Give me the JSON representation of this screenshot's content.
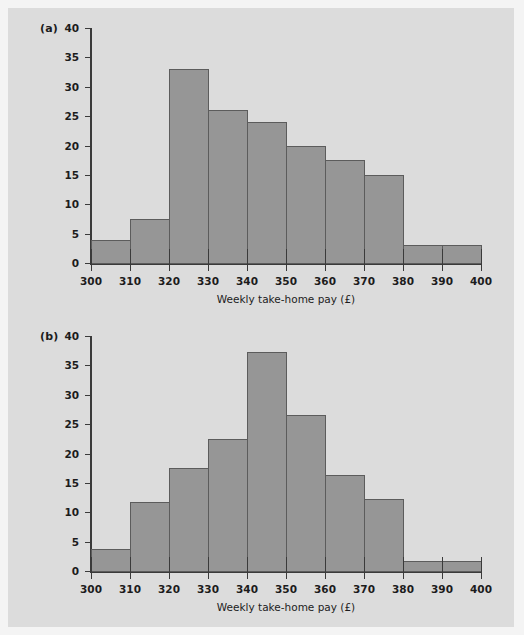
{
  "figure": {
    "background_color": "#dcdcdc",
    "page_background_color": "#f4f4f4",
    "bar_fill_color": "#969696",
    "bar_edge_color": "#5c5c5c",
    "axis_color": "#3a3a3a",
    "text_color": "#1c1c1c"
  },
  "panels": [
    {
      "label": "(a)"
    },
    {
      "label": "(b)"
    }
  ],
  "axis": {
    "xlabel": "Weekly take-home pay (£)",
    "x_ticks": [
      "300",
      "310",
      "320",
      "330",
      "340",
      "350",
      "360",
      "370",
      "380",
      "390",
      "400"
    ],
    "y_ticks": [
      "0",
      "5",
      "10",
      "15",
      "20",
      "25",
      "30",
      "35",
      "40"
    ]
  },
  "chart_data": [
    {
      "type": "bar",
      "panel": "(a)",
      "title": "",
      "xlabel": "Weekly take-home pay (£)",
      "ylabel": "",
      "xlim": [
        300,
        400
      ],
      "ylim": [
        0,
        40
      ],
      "xtick_values": [
        300,
        310,
        320,
        330,
        340,
        350,
        360,
        370,
        380,
        390,
        400
      ],
      "ytick_values": [
        0,
        5,
        10,
        15,
        20,
        25,
        30,
        35,
        40
      ],
      "grid": false,
      "legend": "none",
      "bin_width": 10,
      "bin_edges": [
        300,
        310,
        320,
        330,
        340,
        350,
        360,
        370,
        380,
        390,
        400
      ],
      "categories": [
        "300-310",
        "310-320",
        "320-330",
        "330-340",
        "340-350",
        "350-360",
        "360-370",
        "370-380",
        "380-390",
        "390-400"
      ],
      "values": [
        4,
        7.5,
        33,
        26,
        24,
        20,
        17.5,
        15,
        3,
        3
      ]
    },
    {
      "type": "bar",
      "panel": "(b)",
      "title": "",
      "xlabel": "Weekly take-home pay (£)",
      "ylabel": "",
      "xlim": [
        300,
        400
      ],
      "ylim": [
        0,
        40
      ],
      "xtick_values": [
        300,
        310,
        320,
        330,
        340,
        350,
        360,
        370,
        380,
        390,
        400
      ],
      "ytick_values": [
        0,
        5,
        10,
        15,
        20,
        25,
        30,
        35,
        40
      ],
      "grid": false,
      "legend": "none",
      "bin_width": 10,
      "bin_edges": [
        300,
        310,
        320,
        330,
        340,
        350,
        360,
        370,
        380,
        390,
        400
      ],
      "categories": [
        "300-310",
        "310-320",
        "320-330",
        "330-340",
        "340-350",
        "350-360",
        "360-370",
        "370-380",
        "380-390",
        "390-400"
      ],
      "values": [
        3.8,
        11.7,
        17.6,
        22.5,
        37.2,
        26.5,
        16.3,
        12.2,
        1.7,
        1.7
      ]
    }
  ]
}
